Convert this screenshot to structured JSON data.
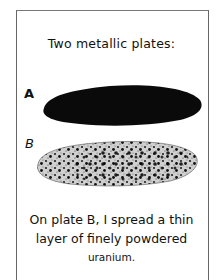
{
  "panel": {
    "title": "Two metallic plates:",
    "plates": [
      {
        "label": "A",
        "appearance": "solid black"
      },
      {
        "label": "B",
        "appearance": "speckled with powder"
      }
    ],
    "caption": {
      "line1": "On plate B, I spread a thin",
      "line2": "layer of finely powdered",
      "line3": "uranium."
    }
  }
}
